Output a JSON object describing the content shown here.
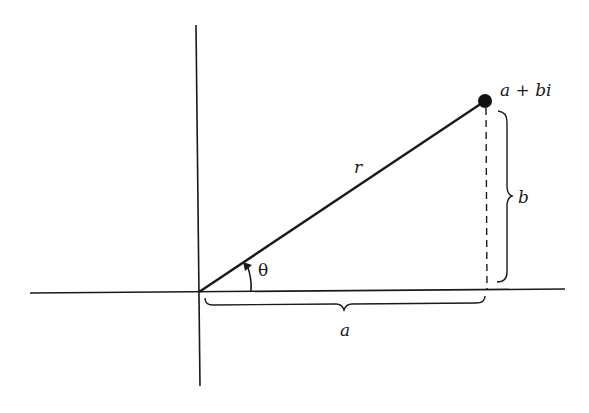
{
  "diagram": {
    "type": "complex-plane-polar-form",
    "colors": {
      "background": "#ffffff",
      "ink": "#1a1a1a"
    },
    "labels": {
      "point": "a + bi",
      "radius": "r",
      "angle": "θ",
      "real_part": "a",
      "imaginary_part": "b"
    },
    "elements": {
      "horizontal_axis": {
        "x1": 30,
        "y1": 293,
        "x2": 565,
        "y2": 289
      },
      "vertical_axis": {
        "x1": 196,
        "y1": 25,
        "x2": 200,
        "y2": 386
      },
      "origin": {
        "x": 199,
        "y": 292
      },
      "point": {
        "x": 485,
        "y": 101
      },
      "dashed_projection": {
        "x": 486,
        "y_top": 108,
        "y_bottom": 290
      },
      "brace_a": {
        "x_start": 205,
        "x_end": 485,
        "y": 303
      },
      "brace_b": {
        "x": 505,
        "y_start": 110,
        "y_end": 282
      }
    }
  }
}
